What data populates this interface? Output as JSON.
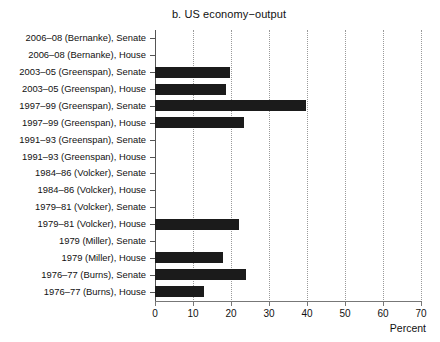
{
  "chart_data": {
    "type": "bar",
    "orientation": "horizontal",
    "title": "b. US economy−output",
    "xlabel": "Percent",
    "ylabel": "",
    "xlim": [
      0,
      70
    ],
    "xticks": [
      0,
      10,
      20,
      30,
      40,
      50,
      60,
      70
    ],
    "xtick_labels": [
      "0",
      "10",
      "20",
      "30",
      "40",
      "50",
      "60",
      "70"
    ],
    "grid": "vertical-dotted",
    "legend": "none",
    "bar_color": "#1b1b1b",
    "categories": [
      "2006–08 (Bernanke), Senate",
      "2006–08 (Bernanke), House",
      "2003–05 (Greenspan), Senate",
      "2003–05 (Greenspan), House",
      "1997–99 (Greenspan), Senate",
      "1997–99 (Greenspan), House",
      "1991–93 (Greenspan), Senate",
      "1991–93 (Greenspan), House",
      "1984–86 (Volcker), Senate",
      "1984–86 (Volcker), House",
      "1979–81 (Volcker), Senate",
      "1979–81 (Volcker), House",
      "1979 (Miller), Senate",
      "1979 (Miller), House",
      "1976–77 (Burns), Senate",
      "1976–77 (Burns), House"
    ],
    "values": [
      0,
      0,
      19.8,
      18.8,
      39.8,
      23.5,
      0,
      0,
      0,
      0,
      0,
      22.0,
      0,
      17.8,
      24.0,
      13.0
    ]
  }
}
